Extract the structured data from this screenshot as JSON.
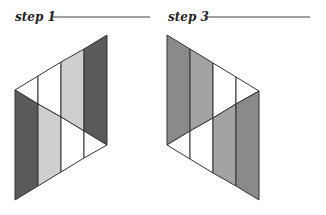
{
  "steps": [
    {
      "label": "step 1",
      "colors": {
        "dark": "#5a5a5a",
        "light": "#cfcfcf",
        "mid": "#8c8c8c"
      }
    },
    {
      "label": "step 3",
      "colors": {
        "dark": "#8a8a8a",
        "mid": "#a3a3a3"
      }
    }
  ],
  "stroke": "#333333"
}
